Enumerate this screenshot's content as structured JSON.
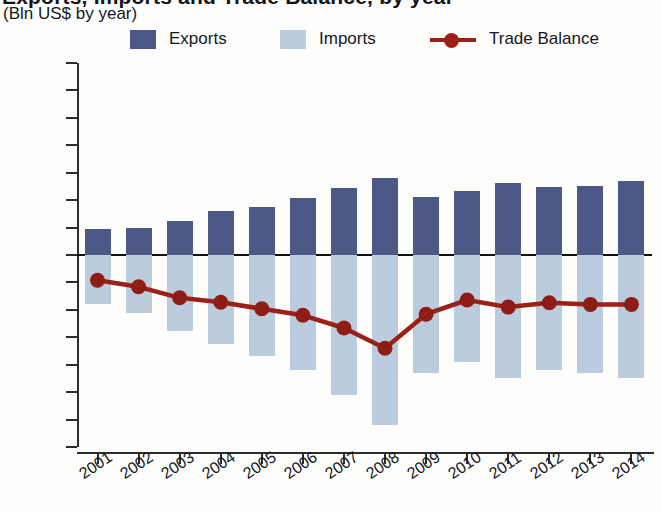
{
  "header": {
    "title_main": "Exports, Imports and Trade Balance, by year",
    "subtitle": "(Bln US$ by year)"
  },
  "legend": {
    "items": [
      {
        "label": "Exports",
        "type": "swatch",
        "color": "#4e5887",
        "name": "legend-exports"
      },
      {
        "label": "Imports",
        "type": "swatch",
        "color": "#bcccdf",
        "name": "legend-imports"
      },
      {
        "label": "Trade Balance",
        "type": "line-marker",
        "color": "#9c2018",
        "name": "legend-trade-balance"
      }
    ]
  },
  "axes": {
    "y_ticks": [
      "35",
      "30",
      "25",
      "20",
      "15",
      "10",
      "5",
      "0",
      "-5",
      "-10",
      "-15",
      "-20",
      "-25",
      "-30",
      "-35"
    ],
    "x_ticks": [
      "2001",
      "2002",
      "2003",
      "2004",
      "2005",
      "2006",
      "2007",
      "2008",
      "2009",
      "2010",
      "2011",
      "2012",
      "2013",
      "2014"
    ]
  },
  "chart_data": {
    "type": "bar",
    "title": "Exports, Imports and Trade Balance, by year",
    "subtitle": "(Bln US$ by year)",
    "xlabel": "",
    "ylabel": "Bln US$",
    "ylim": [
      -35,
      35
    ],
    "ytick_step": 5,
    "grid": false,
    "legend_position": "top",
    "categories": [
      "2001",
      "2002",
      "2003",
      "2004",
      "2005",
      "2006",
      "2007",
      "2008",
      "2009",
      "2010",
      "2011",
      "2012",
      "2013",
      "2014"
    ],
    "series": [
      {
        "name": "Exports",
        "type": "bar",
        "color": "#4e5887",
        "values": [
          4.7,
          5.0,
          6.2,
          8.0,
          8.7,
          10.3,
          12.2,
          14.0,
          10.5,
          11.7,
          13.2,
          12.4,
          12.6,
          13.5
        ]
      },
      {
        "name": "Imports",
        "type": "bar",
        "color": "#bcccdf",
        "values": [
          -9.0,
          -10.5,
          -13.8,
          -16.2,
          -18.5,
          -21.0,
          -25.5,
          -31.0,
          -21.5,
          -19.5,
          -22.5,
          -21.0,
          -21.5,
          -22.5
        ]
      },
      {
        "name": "Trade Balance",
        "type": "line",
        "color": "#9c2018",
        "values": [
          -4.6,
          -5.8,
          -7.8,
          -8.6,
          -9.8,
          -11.0,
          -13.3,
          -17.0,
          -10.8,
          -8.2,
          -9.5,
          -8.7,
          -9.0,
          -9.0
        ]
      }
    ]
  }
}
